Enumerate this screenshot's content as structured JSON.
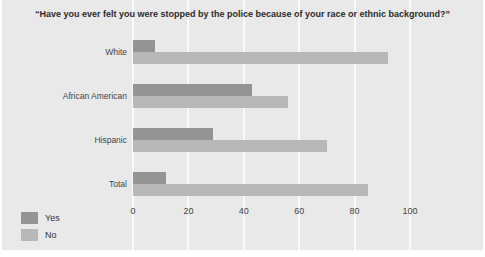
{
  "title": "“Have you ever felt you were stopped by the police because of your race or ethnic background?”",
  "chart_data": {
    "type": "bar",
    "orientation": "horizontal",
    "title": "“Have you ever felt you were stopped by the police because of your race or ethnic background?”",
    "categories": [
      "White",
      "African American",
      "Hispanic",
      "Total"
    ],
    "series": [
      {
        "name": "Yes",
        "color": "#949494",
        "values": [
          8,
          43,
          29,
          12
        ]
      },
      {
        "name": "No",
        "color": "#b8b8b8",
        "values": [
          92,
          56,
          70,
          85
        ]
      }
    ],
    "xlabel": "",
    "ylabel": "",
    "xlim": [
      0,
      100
    ],
    "xticks": [
      0,
      20,
      40,
      60,
      80,
      100
    ],
    "grid": "vertical-white-gridlines",
    "legend_position": "bottom-left",
    "background_color": "#e9e9e9",
    "gridline_color": "#fafafa"
  }
}
